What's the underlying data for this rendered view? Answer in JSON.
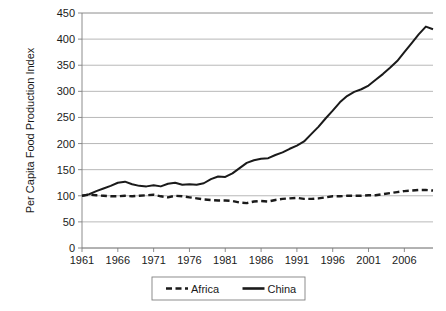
{
  "chart_data": {
    "type": "line",
    "title": "",
    "xlabel": "",
    "ylabel": "Per Capita Food Production Index",
    "xlim": [
      1961,
      2010
    ],
    "ylim": [
      0,
      450
    ],
    "ytick_labels": [
      "0",
      "50",
      "100",
      "150",
      "200",
      "250",
      "300",
      "350",
      "400",
      "450"
    ],
    "ytick_values": [
      0,
      50,
      100,
      150,
      200,
      250,
      300,
      350,
      400,
      450
    ],
    "xtick_labels": [
      "1961",
      "1966",
      "1971",
      "1976",
      "1981",
      "1986",
      "1991",
      "1996",
      "2001",
      "2006"
    ],
    "xtick_values": [
      1961,
      1966,
      1971,
      1976,
      1981,
      1986,
      1991,
      1996,
      2001,
      2006
    ],
    "grid": "horizontal",
    "legend_position": "bottom",
    "x": [
      1961,
      1962,
      1963,
      1964,
      1965,
      1966,
      1967,
      1968,
      1969,
      1970,
      1971,
      1972,
      1973,
      1974,
      1975,
      1976,
      1977,
      1978,
      1979,
      1980,
      1981,
      1982,
      1983,
      1984,
      1985,
      1986,
      1987,
      1988,
      1989,
      1990,
      1991,
      1992,
      1993,
      1994,
      1995,
      1996,
      1997,
      1998,
      1999,
      2000,
      2001,
      2002,
      2003,
      2004,
      2005,
      2006,
      2007,
      2008,
      2009,
      2010
    ],
    "series": [
      {
        "name": "Africa",
        "style": "dashed",
        "color": "#1a1a1a",
        "values": [
          100,
          102,
          101,
          100,
          99,
          99,
          100,
          99,
          100,
          101,
          102,
          99,
          97,
          100,
          99,
          97,
          95,
          93,
          92,
          91,
          91,
          90,
          87,
          86,
          89,
          90,
          89,
          92,
          94,
          95,
          96,
          94,
          94,
          95,
          97,
          99,
          99,
          100,
          100,
          100,
          101,
          101,
          103,
          105,
          107,
          109,
          110,
          111,
          111,
          110
        ]
      },
      {
        "name": "China",
        "style": "solid",
        "color": "#1a1a1a",
        "values": [
          100,
          103,
          109,
          114,
          119,
          125,
          127,
          122,
          119,
          118,
          120,
          118,
          123,
          125,
          121,
          122,
          121,
          124,
          132,
          137,
          136,
          143,
          153,
          163,
          168,
          171,
          172,
          178,
          183,
          190,
          196,
          204,
          218,
          232,
          248,
          263,
          279,
          291,
          299,
          304,
          311,
          322,
          333,
          345,
          358,
          375,
          392,
          409,
          424,
          419
        ]
      }
    ]
  },
  "legend": {
    "items": [
      {
        "label": "Africa",
        "style": "dashed"
      },
      {
        "label": "China",
        "style": "solid"
      }
    ]
  }
}
